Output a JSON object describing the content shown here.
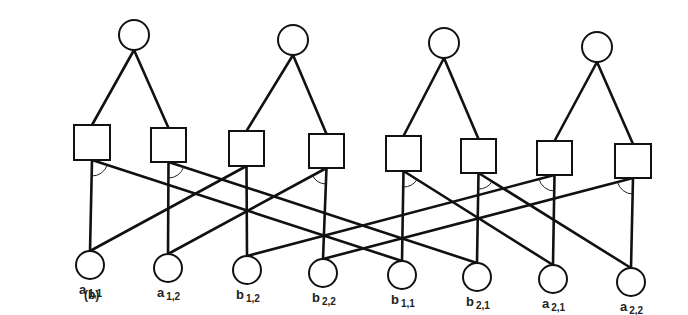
{
  "figure": {
    "panel_label": "(b)",
    "top_nodes": [
      {
        "id": "T1",
        "cx": 134,
        "cy": 35,
        "r": 15
      },
      {
        "id": "T2",
        "cx": 293,
        "cy": 40,
        "r": 15
      },
      {
        "id": "T3",
        "cx": 444,
        "cy": 43,
        "r": 15
      },
      {
        "id": "T4",
        "cx": 597,
        "cy": 47,
        "r": 15
      }
    ],
    "middle_nodes": [
      {
        "id": "S1",
        "x": 74,
        "y": 125,
        "w": 36,
        "h": 35,
        "parent": "T1"
      },
      {
        "id": "S2",
        "x": 151,
        "y": 128,
        "w": 35,
        "h": 34,
        "parent": "T1"
      },
      {
        "id": "S3",
        "x": 229,
        "y": 131,
        "w": 35,
        "h": 35,
        "parent": "T2"
      },
      {
        "id": "S4",
        "x": 309,
        "y": 134,
        "w": 35,
        "h": 34,
        "parent": "T2"
      },
      {
        "id": "S5",
        "x": 386,
        "y": 136,
        "w": 35,
        "h": 35,
        "parent": "T3"
      },
      {
        "id": "S6",
        "x": 461,
        "y": 139,
        "w": 35,
        "h": 34,
        "parent": "T3"
      },
      {
        "id": "S7",
        "x": 537,
        "y": 141,
        "w": 35,
        "h": 34,
        "parent": "T4"
      },
      {
        "id": "S8",
        "x": 615,
        "y": 144,
        "w": 36,
        "h": 34,
        "parent": "T4"
      }
    ],
    "bottom_nodes": [
      {
        "id": "B1",
        "cx": 90,
        "cy": 265,
        "r": 14,
        "label": "a",
        "sub": "1,1"
      },
      {
        "id": "B2",
        "cx": 168,
        "cy": 268,
        "r": 14,
        "label": "a",
        "sub": "1,2"
      },
      {
        "id": "B3",
        "cx": 247,
        "cy": 270,
        "r": 14,
        "label": "b",
        "sub": "1,2"
      },
      {
        "id": "B4",
        "cx": 323,
        "cy": 273,
        "r": 14,
        "label": "b",
        "sub": "2,2"
      },
      {
        "id": "B5",
        "cx": 402,
        "cy": 275,
        "r": 14,
        "label": "b",
        "sub": "1,1"
      },
      {
        "id": "B6",
        "cx": 477,
        "cy": 277,
        "r": 14,
        "label": "b",
        "sub": "2,1"
      },
      {
        "id": "B7",
        "cx": 553,
        "cy": 279,
        "r": 14,
        "label": "a",
        "sub": "2,1"
      },
      {
        "id": "B8",
        "cx": 631,
        "cy": 282,
        "r": 14,
        "label": "a",
        "sub": "2,2"
      }
    ],
    "square_to_bottom_edges": [
      {
        "square": "S1",
        "targets": [
          "B1",
          "B5"
        ],
        "arc": "right"
      },
      {
        "square": "S2",
        "targets": [
          "B2",
          "B6"
        ],
        "arc": "right"
      },
      {
        "square": "S3",
        "targets": [
          "B3",
          "B1"
        ],
        "arc": "none"
      },
      {
        "square": "S4",
        "targets": [
          "B4",
          "B2"
        ],
        "arc": "left"
      },
      {
        "square": "S5",
        "targets": [
          "B5",
          "B7"
        ],
        "arc": "right"
      },
      {
        "square": "S6",
        "targets": [
          "B6",
          "B8"
        ],
        "arc": "right"
      },
      {
        "square": "S7",
        "targets": [
          "B7",
          "B3"
        ],
        "arc": "left"
      },
      {
        "square": "S8",
        "targets": [
          "B8",
          "B4"
        ],
        "arc": "left"
      }
    ]
  },
  "colors": {
    "stroke": "#111111",
    "background": "#ffffff"
  }
}
